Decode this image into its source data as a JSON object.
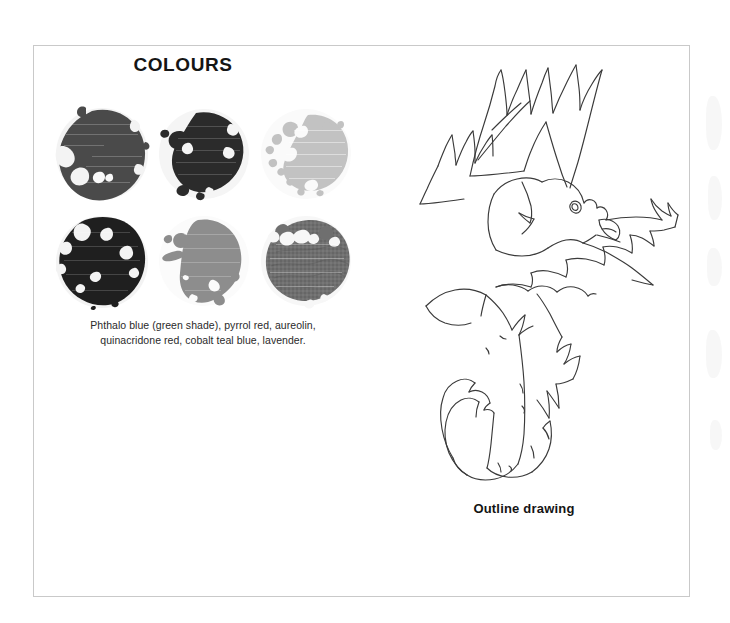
{
  "page": {
    "background_color": "#ffffff",
    "frame_border_color": "#c9c9c9"
  },
  "colours_panel": {
    "title": "COLOURS",
    "caption_line_1": "Phthalo blue (green shade), pyrrol red, aureolin,",
    "caption_line_2": "quinacridone red, cobalt teal blue, lavender.",
    "caption_full": "Phthalo blue (green shade), pyrrol red, aureolin, quinacridone red, cobalt teal blue, lavender.",
    "swatches": [
      {
        "index": 1,
        "name": "phthalo-blue-green-shade",
        "label": "Phthalo blue (green shade)",
        "row": 1,
        "column": 1,
        "tone": "dark",
        "color": "#4a4a4a",
        "halo_color": "#f3f3f3",
        "texture": "granulating"
      },
      {
        "index": 2,
        "name": "pyrrol-red",
        "label": "pyrrol red",
        "row": 1,
        "column": 2,
        "tone": "very-dark",
        "color": "#2b2b2b",
        "halo_color": "#f5f5f5",
        "texture": "solid"
      },
      {
        "index": 3,
        "name": "aureolin",
        "label": "aureolin",
        "row": 1,
        "column": 3,
        "tone": "light",
        "color": "#c2c2c2",
        "halo_color": "#fafafa",
        "texture": "mottled"
      },
      {
        "index": 4,
        "name": "quinacridone-red",
        "label": "quinacridone red",
        "row": 2,
        "column": 1,
        "tone": "near-black",
        "color": "#1f1f1f",
        "halo_color": "#f3f3f3",
        "texture": "solid"
      },
      {
        "index": 5,
        "name": "cobalt-teal-blue",
        "label": "cobalt teal blue",
        "row": 2,
        "column": 2,
        "tone": "mid",
        "color": "#8d8d8d",
        "halo_color": "#fbfbfb",
        "texture": "flat"
      },
      {
        "index": 6,
        "name": "lavender",
        "label": "lavender",
        "row": 2,
        "column": 3,
        "tone": "mid-dark",
        "color": "#6f6f6f",
        "halo_color": "#f7f7f7",
        "texture": "granulating"
      }
    ]
  },
  "drawing_panel": {
    "caption": "Outline drawing",
    "subject": "rooster in flight, line sketch",
    "line_color": "#3a3a3a"
  }
}
